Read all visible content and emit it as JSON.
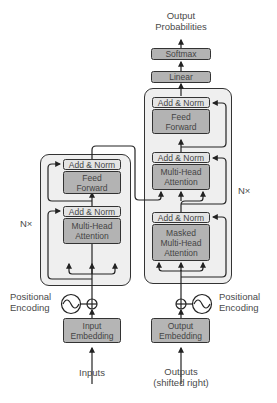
{
  "diagram": {
    "output_label": "Output\nProbabilities",
    "output_label_line1": "Output",
    "output_label_line2": "Probabilities",
    "softmax": "Softmax",
    "linear": "Linear",
    "encoder": {
      "repeat": "N×",
      "add_norm_top": "Add & Norm",
      "feed_forward_line1": "Feed",
      "feed_forward_line2": "Forward",
      "add_norm_bottom": "Add & Norm",
      "attention_line1": "Multi-Head",
      "attention_line2": "Attention",
      "positional_line1": "Positional",
      "positional_line2": "Encoding",
      "embedding_line1": "Input",
      "embedding_line2": "Embedding",
      "input_label": "Inputs"
    },
    "decoder": {
      "repeat": "N×",
      "add_norm_1": "Add & Norm",
      "feed_forward_line1": "Feed",
      "feed_forward_line2": "Forward",
      "add_norm_2": "Add & Norm",
      "attention_line1": "Multi-Head",
      "attention_line2": "Attention",
      "add_norm_3": "Add & Norm",
      "masked_line1": "Masked",
      "masked_line2": "Multi-Head",
      "masked_line3": "Attention",
      "positional_line1": "Positional",
      "positional_line2": "Encoding",
      "embedding_line1": "Output",
      "embedding_line2": "Embedding",
      "output_label_line1": "Outputs",
      "output_label_line2": "(shifted right)"
    },
    "colors": {
      "block_bg": "#efefef",
      "add_norm": "#e4e4e4",
      "sublayer": "#b3b3b3",
      "embedding": "#b5b5b5",
      "stroke": "#333333"
    }
  }
}
